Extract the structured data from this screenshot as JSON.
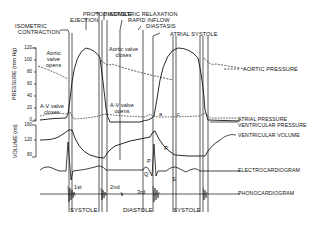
{
  "diagram": {
    "phases_top": {
      "isometric_contraction": "ISOMETRIC CONTRACTION",
      "isometric_contraction_l1": "ISOMETRIC",
      "isometric_contraction_l2": "CONTRACTION",
      "ejection": "EJECTION",
      "protodiastole": "PROTODIASTOLE",
      "isometric_relaxation": "ISOMETRIC RELAXATION",
      "rapid_inflow": "RAPID  INFLOW",
      "diastasis": "DIASTASIS",
      "atrial_systole": "ATRIAL  SYSTOLE"
    },
    "pressure_axis": {
      "label": "PRESSURE (mm Hg)",
      "ticks": [
        "120",
        "100",
        "80",
        "60",
        "40",
        "20",
        "0"
      ]
    },
    "volume_axis": {
      "label": "VOLUME (ml)",
      "ticks": [
        "160",
        "120",
        "80"
      ]
    },
    "annotations": {
      "aortic_valve_opens": [
        "Aortic",
        "valve",
        "opens"
      ],
      "aortic_valve_closes": [
        "Aortic valve",
        "closes"
      ],
      "av_valve_closes": [
        "A-V valve",
        "closes"
      ],
      "av_valve_opens": [
        "A-V valve",
        "opens"
      ],
      "a_wave": "a",
      "c_wave": "c",
      "v_wave": "v",
      "ecg_p": "P",
      "ecg_q": "Q",
      "ecg_r": "R",
      "ecg_s": "S",
      "heart_sound_1": "1st",
      "heart_sound_2": "2nd",
      "heart_sound_3": "3rd"
    },
    "legend_right": {
      "aortic_pressure": "AORTIC PRESSURE",
      "atrial_pressure": "ATRIAL PRESSURE",
      "ventricular_pressure": "VENTRICULAR PRESSURE",
      "ventricular_volume": "VENTRICULAR VOLUME",
      "electrocardiogram": "ELECTROCARDIOGRAM",
      "phonocardiogram": "PHONOCARDIOGRAM"
    },
    "phases_bottom": {
      "systole_1": "SYSTOLE",
      "diastole": "DIASTOLE",
      "systole_2": "SYSTOLE"
    },
    "colors": {
      "line": "#111111",
      "background": "#ffffff"
    }
  }
}
